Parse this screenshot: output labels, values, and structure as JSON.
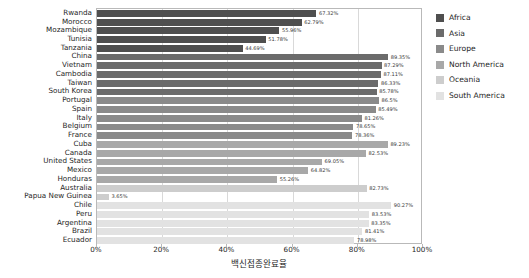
{
  "chart_data": {
    "type": "bar",
    "orientation": "horizontal",
    "title": "",
    "xlabel": "백신접종완료율",
    "ylabel": "",
    "xlim": [
      0,
      100
    ],
    "xticks": [
      "0%",
      "20%",
      "40%",
      "60%",
      "80%",
      "100%"
    ],
    "xtick_values": [
      0,
      20,
      40,
      60,
      80,
      100
    ],
    "grid": true,
    "legend_position": "right",
    "legend": [
      {
        "name": "Africa",
        "color": "#4f4f4f"
      },
      {
        "name": "Asia",
        "color": "#6b6b6b"
      },
      {
        "name": "Europe",
        "color": "#8a8a8a"
      },
      {
        "name": "North America",
        "color": "#a8a8a8"
      },
      {
        "name": "Oceania",
        "color": "#cdcdcd"
      },
      {
        "name": "South America",
        "color": "#e2e2e2"
      }
    ],
    "categories": [
      "Rwanda",
      "Morocco",
      "Mozambique",
      "Tunisia",
      "Tanzania",
      "China",
      "Vietnam",
      "Cambodia",
      "Taiwan",
      "South Korea",
      "Portugal",
      "Spain",
      "Italy",
      "Belgium",
      "France",
      "Cuba",
      "Canada",
      "United States",
      "Mexico",
      "Honduras",
      "Australia",
      "Papua New Guinea",
      "Chile",
      "Peru",
      "Argentina",
      "Brazil",
      "Ecuador"
    ],
    "values": [
      67.32,
      62.79,
      55.96,
      51.78,
      44.69,
      89.35,
      87.29,
      87.11,
      86.33,
      85.78,
      86.5,
      85.49,
      81.26,
      78.65,
      78.36,
      89.23,
      82.53,
      69.05,
      64.82,
      55.26,
      82.73,
      3.65,
      90.27,
      83.53,
      83.35,
      81.41,
      78.98
    ],
    "value_labels": [
      "67.32%",
      "62.79%",
      "55.96%",
      "51.78%",
      "44.69%",
      "89.35%",
      "87.29%",
      "87.11%",
      "86.33%",
      "85.78%",
      "86.5%",
      "85.49%",
      "81.26%",
      "78.65%",
      "78.36%",
      "89.23%",
      "82.53%",
      "69.05%",
      "64.82%",
      "55.26%",
      "82.73%",
      "3.65%",
      "90.27%",
      "83.53%",
      "83.35%",
      "81.41%",
      "78.98%"
    ],
    "groups": [
      "Africa",
      "Africa",
      "Africa",
      "Africa",
      "Africa",
      "Asia",
      "Asia",
      "Asia",
      "Asia",
      "Asia",
      "Europe",
      "Europe",
      "Europe",
      "Europe",
      "Europe",
      "North America",
      "North America",
      "North America",
      "North America",
      "North America",
      "Oceania",
      "Oceania",
      "South America",
      "South America",
      "South America",
      "South America",
      "South America"
    ],
    "colors": [
      "#4f4f4f",
      "#4f4f4f",
      "#4f4f4f",
      "#4f4f4f",
      "#4f4f4f",
      "#6b6b6b",
      "#6b6b6b",
      "#6b6b6b",
      "#6b6b6b",
      "#6b6b6b",
      "#8a8a8a",
      "#8a8a8a",
      "#8a8a8a",
      "#8a8a8a",
      "#8a8a8a",
      "#a8a8a8",
      "#a8a8a8",
      "#a8a8a8",
      "#a8a8a8",
      "#a8a8a8",
      "#cdcdcd",
      "#cdcdcd",
      "#e2e2e2",
      "#e2e2e2",
      "#e2e2e2",
      "#e2e2e2",
      "#e2e2e2"
    ]
  }
}
